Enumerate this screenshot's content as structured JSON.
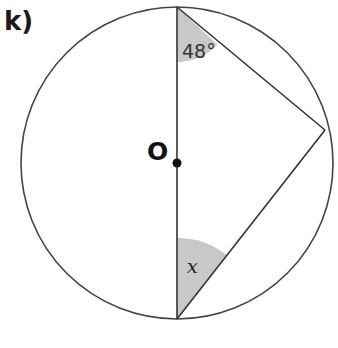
{
  "question_label": "k)",
  "diagram": {
    "circle": {
      "cx": 177,
      "cy": 163,
      "r": 156,
      "stroke": "#444444"
    },
    "center_label": "O",
    "points": {
      "top": [
        177,
        7
      ],
      "bottom": [
        177,
        319
      ],
      "right": [
        325,
        130
      ]
    },
    "angles": [
      {
        "vertex": "top",
        "label": "48°",
        "fill": "#c8c8c8"
      },
      {
        "vertex": "bottom",
        "label": "x",
        "fill": "#c8c8c8"
      }
    ],
    "shade_color": "#c8c8c8",
    "line_color": "#333333"
  }
}
